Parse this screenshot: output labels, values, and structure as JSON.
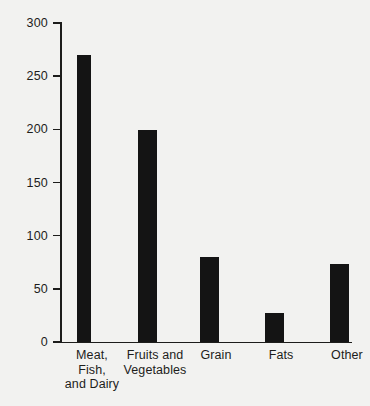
{
  "chart_data": {
    "type": "bar",
    "title": "",
    "subtitle": "",
    "xlabel": "",
    "ylabel": "",
    "categories": [
      "Meat, Fish, and Dairy",
      "Fruits and Vegetables",
      "Grain",
      "Fats",
      "Other"
    ],
    "category_lines": [
      [
        "Meat,",
        "Fish,",
        "and Dairy"
      ],
      [
        "Fruits and",
        "Vegetables"
      ],
      [
        "Grain"
      ],
      [
        "Fats"
      ],
      [
        "Other"
      ]
    ],
    "values": [
      270,
      199,
      80,
      27,
      73
    ],
    "ylim": [
      0,
      300
    ],
    "yticks": [
      0,
      50,
      100,
      150,
      200,
      250,
      300
    ],
    "ytick_labels": [
      "0",
      "50",
      "100",
      "150",
      "200",
      "250",
      "300"
    ],
    "grid": false,
    "legend": null,
    "legend_position": "none",
    "bar_color": "#141414",
    "axis_color": "#1d1d1b",
    "background_color": "#f2f2f0",
    "annotations": []
  }
}
